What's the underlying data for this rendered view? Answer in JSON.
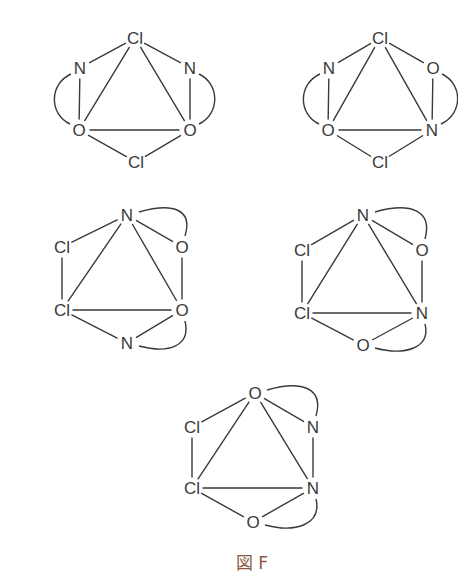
{
  "caption": "図 F",
  "colors": {
    "line": "#3a3a3a",
    "caption": "#8a5a44",
    "background": "#ffffff"
  },
  "structures": [
    {
      "id": "structure-1",
      "atoms": [
        {
          "label": "Cl",
          "x": 135,
          "y": 38
        },
        {
          "label": "N",
          "x": 80,
          "y": 68
        },
        {
          "label": "N",
          "x": 190,
          "y": 68
        },
        {
          "label": "O",
          "x": 79,
          "y": 130
        },
        {
          "label": "O",
          "x": 190,
          "y": 130
        },
        {
          "label": "Cl",
          "x": 136,
          "y": 162
        }
      ],
      "bonds": [
        [
          0,
          1
        ],
        [
          0,
          2
        ],
        [
          0,
          3
        ],
        [
          0,
          4
        ],
        [
          1,
          3
        ],
        [
          2,
          4
        ],
        [
          3,
          4
        ],
        [
          3,
          5
        ],
        [
          4,
          5
        ]
      ],
      "arcs": [
        {
          "from": 1,
          "to": 3,
          "side": "left"
        },
        {
          "from": 2,
          "to": 4,
          "side": "right"
        }
      ]
    },
    {
      "id": "structure-2",
      "atoms": [
        {
          "label": "Cl",
          "x": 380,
          "y": 38
        },
        {
          "label": "N",
          "x": 329,
          "y": 68
        },
        {
          "label": "O",
          "x": 433,
          "y": 68
        },
        {
          "label": "O",
          "x": 328,
          "y": 130
        },
        {
          "label": "N",
          "x": 432,
          "y": 130
        },
        {
          "label": "Cl",
          "x": 380,
          "y": 162
        }
      ],
      "bonds": [
        [
          0,
          1
        ],
        [
          0,
          2
        ],
        [
          0,
          3
        ],
        [
          0,
          4
        ],
        [
          1,
          3
        ],
        [
          2,
          4
        ],
        [
          3,
          4
        ],
        [
          3,
          5
        ],
        [
          4,
          5
        ]
      ],
      "arcs": [
        {
          "from": 1,
          "to": 3,
          "side": "left"
        },
        {
          "from": 2,
          "to": 4,
          "side": "right"
        }
      ]
    },
    {
      "id": "structure-3",
      "atoms": [
        {
          "label": "N",
          "x": 127,
          "y": 215
        },
        {
          "label": "Cl",
          "x": 62,
          "y": 247
        },
        {
          "label": "O",
          "x": 182,
          "y": 247
        },
        {
          "label": "Cl",
          "x": 62,
          "y": 310
        },
        {
          "label": "O",
          "x": 182,
          "y": 310
        },
        {
          "label": "N",
          "x": 127,
          "y": 343
        }
      ],
      "bonds": [
        [
          0,
          1
        ],
        [
          0,
          2
        ],
        [
          0,
          3
        ],
        [
          0,
          4
        ],
        [
          1,
          3
        ],
        [
          2,
          4
        ],
        [
          3,
          4
        ],
        [
          3,
          5
        ],
        [
          4,
          5
        ]
      ],
      "arcs": [
        {
          "from": 0,
          "to": 2,
          "side": "top"
        },
        {
          "from": 4,
          "to": 5,
          "side": "bottom"
        }
      ]
    },
    {
      "id": "structure-4",
      "atoms": [
        {
          "label": "N",
          "x": 363,
          "y": 215
        },
        {
          "label": "Cl",
          "x": 302,
          "y": 250
        },
        {
          "label": "O",
          "x": 422,
          "y": 250
        },
        {
          "label": "Cl",
          "x": 302,
          "y": 313
        },
        {
          "label": "N",
          "x": 422,
          "y": 313
        },
        {
          "label": "O",
          "x": 363,
          "y": 345
        }
      ],
      "bonds": [
        [
          0,
          1
        ],
        [
          0,
          2
        ],
        [
          0,
          3
        ],
        [
          0,
          4
        ],
        [
          1,
          3
        ],
        [
          2,
          4
        ],
        [
          3,
          4
        ],
        [
          3,
          5
        ],
        [
          4,
          5
        ]
      ],
      "arcs": [
        {
          "from": 0,
          "to": 2,
          "side": "top"
        },
        {
          "from": 4,
          "to": 5,
          "side": "bottom"
        }
      ]
    },
    {
      "id": "structure-5",
      "atoms": [
        {
          "label": "O",
          "x": 255,
          "y": 393
        },
        {
          "label": "Cl",
          "x": 192,
          "y": 427
        },
        {
          "label": "N",
          "x": 313,
          "y": 427
        },
        {
          "label": "Cl",
          "x": 192,
          "y": 488
        },
        {
          "label": "N",
          "x": 313,
          "y": 488
        },
        {
          "label": "O",
          "x": 253,
          "y": 522
        }
      ],
      "bonds": [
        [
          0,
          1
        ],
        [
          0,
          2
        ],
        [
          0,
          3
        ],
        [
          0,
          4
        ],
        [
          1,
          3
        ],
        [
          2,
          4
        ],
        [
          3,
          4
        ],
        [
          3,
          5
        ],
        [
          4,
          5
        ]
      ],
      "arcs": [
        {
          "from": 0,
          "to": 2,
          "side": "top"
        },
        {
          "from": 4,
          "to": 5,
          "side": "bottom"
        }
      ]
    }
  ],
  "caption_pos": {
    "x": 252,
    "y": 563
  }
}
